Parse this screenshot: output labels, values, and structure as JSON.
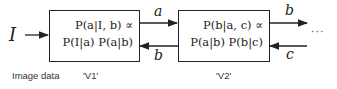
{
  "diagram": {
    "input": {
      "symbol": "I"
    },
    "blocks": [
      {
        "id": "V1",
        "line1": "P(a|I, b) ∝",
        "line2": "P(I|a) P(a|b)",
        "caption": "'V1'"
      },
      {
        "id": "V2",
        "line1": "P(b|a, c) ∝",
        "line2": "P(a|b) P(b|c)",
        "caption": "'V2'"
      }
    ],
    "edges": [
      {
        "from": "input",
        "to": "V1",
        "label": ""
      },
      {
        "from": "V1",
        "to": "V2",
        "label": "a"
      },
      {
        "from": "V2",
        "to": "V1",
        "label": "b"
      },
      {
        "from": "V2",
        "to": "next",
        "label": "b"
      },
      {
        "from": "next",
        "to": "V2",
        "label": "c"
      }
    ],
    "continuation": "···",
    "input_caption": "Image data"
  }
}
